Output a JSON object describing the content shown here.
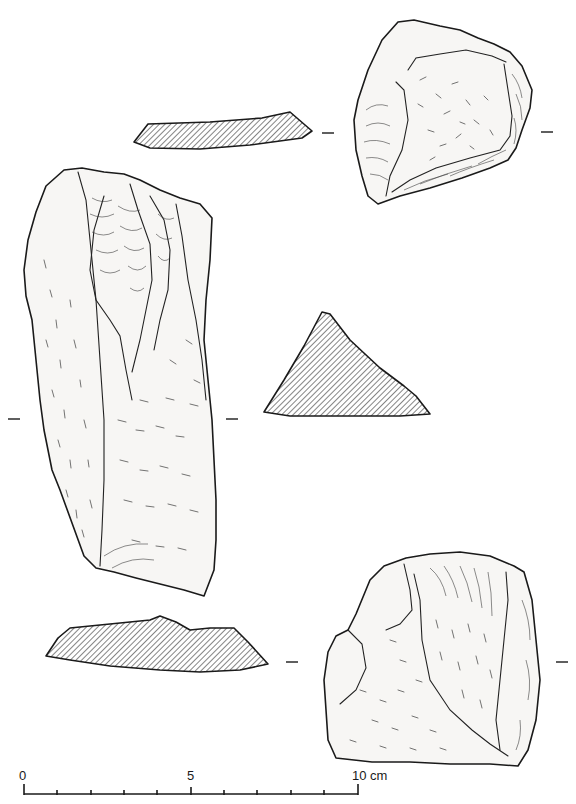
{
  "figure": {
    "type": "archaeological lithic illustration",
    "line_color": "#1a1a1a",
    "background": "#ffffff",
    "hatch_color": "#333333"
  },
  "artifacts": [
    {
      "id": "blade-core",
      "view": "dorsal face",
      "section": "triangular cross-section"
    },
    {
      "id": "flake-top-right",
      "view": "dorsal face",
      "section": "thin tabular cross-section (top)"
    },
    {
      "id": "flake-bottom-right",
      "view": "dorsal face",
      "section": "lenticular cross-section (bottom)"
    }
  ],
  "scale_bar": {
    "labels": [
      "0",
      "5",
      "10 cm"
    ],
    "unit": "cm",
    "min": 0,
    "max": 10,
    "tick_count": 11
  }
}
